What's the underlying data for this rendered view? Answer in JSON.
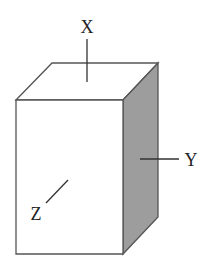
{
  "diagram": {
    "type": "rectangular-prism-axes",
    "colors": {
      "outline": "#555555",
      "front_face": "#ffffff",
      "top_face": "#ffffff",
      "side_face": "#9d9d9d",
      "label": "#222222"
    },
    "labels": {
      "x": "X",
      "y": "Y",
      "z": "Z"
    }
  }
}
